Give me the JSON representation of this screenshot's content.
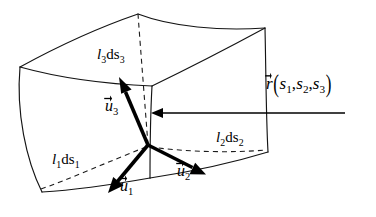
{
  "figure": {
    "type": "curvilinear-coordinate-volume-element-diagram",
    "background_color": "#ffffff",
    "line_color": "#141414",
    "vector_color": "#000000"
  },
  "labels": {
    "l3ds3": {
      "scale": "l",
      "scale_sub": "3",
      "diff": "ds",
      "diff_sub": "3"
    },
    "l2ds2": {
      "scale": "l",
      "scale_sub": "2",
      "diff": "ds",
      "diff_sub": "2"
    },
    "l1ds1": {
      "scale": "l",
      "scale_sub": "1",
      "diff": "ds",
      "diff_sub": "1"
    },
    "u3": {
      "symbol": "u",
      "sub": "3"
    },
    "u2": {
      "symbol": "u",
      "sub": "2"
    },
    "u1": {
      "symbol": "u",
      "sub": "1"
    },
    "position_vector": {
      "symbol": "r",
      "open_paren": "(",
      "arg1": "s",
      "arg1_sub": "1",
      "sep1": ",",
      "arg2": "s",
      "arg2_sub": "2",
      "sep2": ",",
      "arg3": "s",
      "arg3_sub": "3",
      "close_paren": ")"
    }
  },
  "geometry": {
    "origin_point": [
      148,
      145
    ],
    "top_ridge_peak": [
      138,
      14
    ],
    "top_left_vertex": [
      20,
      67
    ],
    "top_right_vertex": [
      265,
      28
    ],
    "reference_arrow": {
      "from": [
        345,
        113
      ],
      "to": [
        152,
        113
      ]
    },
    "unit_vectors": [
      {
        "name": "u1",
        "from": [
          148,
          145
        ],
        "to": [
          112,
          188
        ]
      },
      {
        "name": "u2",
        "from": [
          148,
          145
        ],
        "to": [
          200,
          172
        ]
      },
      {
        "name": "u3",
        "from": [
          148,
          145
        ],
        "to": [
          122,
          85
        ]
      }
    ],
    "dashed_lines": [
      {
        "name": "l3ds3-vertical",
        "from": [
          138,
          14
        ],
        "to": [
          148,
          145
        ]
      },
      {
        "name": "l2ds2-right",
        "from": [
          148,
          145
        ],
        "to": [
          266,
          150
        ]
      },
      {
        "name": "l1ds1-left",
        "from": [
          148,
          145
        ],
        "to": [
          38,
          190
        ]
      }
    ]
  }
}
